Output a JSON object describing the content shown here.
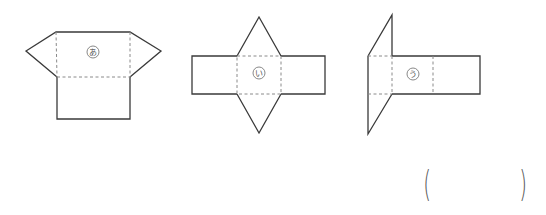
{
  "figures": [
    {
      "id": "a",
      "label": "あ",
      "description": "rectangle top face with two triangular side flaps and rectangle below"
    },
    {
      "id": "i",
      "label": "い",
      "description": "square center with two triangles above/below and rectangles left/right"
    },
    {
      "id": "u",
      "label": "う",
      "description": "long rectangle with parallelogram-like triangles on the left side"
    }
  ],
  "answer": {
    "open": "(",
    "close": ")",
    "value": ""
  }
}
